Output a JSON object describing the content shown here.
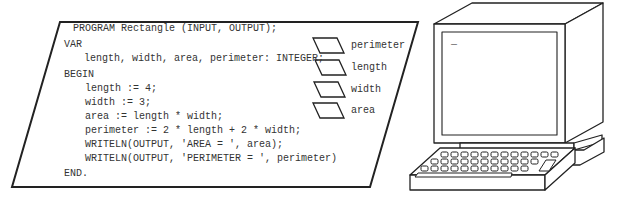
{
  "program": {
    "lines": [
      {
        "text": "PROGRAM Rectangle (INPUT, OUTPUT);",
        "x": 73,
        "y": 28
      },
      {
        "text": "VAR",
        "x": 64,
        "y": 44
      },
      {
        "text": "length, width, area, perimeter: INTEGER;",
        "x": 84,
        "y": 58
      },
      {
        "text": "BEGIN",
        "x": 64,
        "y": 74
      },
      {
        "text": "length := 4;",
        "x": 85,
        "y": 88
      },
      {
        "text": "width := 3;",
        "x": 85,
        "y": 102
      },
      {
        "text": "area := length * width;",
        "x": 85,
        "y": 116
      },
      {
        "text": "perimeter := 2 * length + 2 * width;",
        "x": 85,
        "y": 130
      },
      {
        "text": "WRITELN(OUTPUT, 'AREA = ', area);",
        "x": 85,
        "y": 144
      },
      {
        "text": "WRITELN(OUTPUT, 'PERIMETER = ', perimeter)",
        "x": 85,
        "y": 158
      },
      {
        "text": "END.",
        "x": 64,
        "y": 173
      }
    ]
  },
  "variables": [
    {
      "name": "perimeter",
      "y": 40
    },
    {
      "name": "length",
      "y": 62
    },
    {
      "name": "width",
      "y": 84
    },
    {
      "name": "area",
      "y": 105
    }
  ],
  "computer": {
    "screen_cursor": "_"
  }
}
